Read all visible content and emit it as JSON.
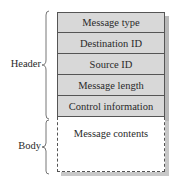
{
  "diagram": {
    "groups": [
      {
        "label": "Header"
      },
      {
        "label": "Body"
      }
    ],
    "header_fields": [
      {
        "label": "Message type"
      },
      {
        "label": "Destination ID"
      },
      {
        "label": "Source ID"
      },
      {
        "label": "Message length"
      },
      {
        "label": "Control information"
      }
    ],
    "body_field": {
      "label": "Message contents"
    },
    "colors": {
      "header_fill": "#d8d8d8",
      "body_fill": "#ffffff",
      "border": "#555555",
      "shadow": "#b8b8b8"
    }
  }
}
